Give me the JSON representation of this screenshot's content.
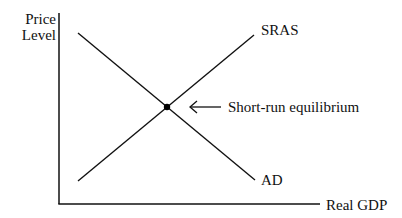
{
  "diagram": {
    "type": "aggregate-supply-demand",
    "y_axis_label_line1": "Price",
    "y_axis_label_line2": "Level",
    "x_axis_label": "Real GDP",
    "curves": [
      {
        "name": "SRAS",
        "label": "SRAS",
        "from": [
          78,
          181
        ],
        "to": [
          254,
          35
        ]
      },
      {
        "name": "AD",
        "label": "AD",
        "from": [
          78,
          33
        ],
        "to": [
          255,
          180
        ]
      }
    ],
    "equilibrium": {
      "label": "Short-run equilibrium",
      "point": [
        167,
        107
      ]
    },
    "colors": {
      "line": "#111111",
      "background": "#ffffff"
    }
  }
}
